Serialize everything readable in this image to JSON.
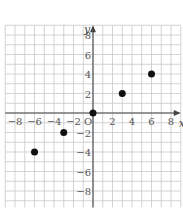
{
  "chart_data": {
    "type": "scatter",
    "title": "",
    "xlabel": "x",
    "ylabel": "y",
    "origin_label": "O",
    "xlim": [
      -9,
      9
    ],
    "ylim": [
      -9.7,
      9
    ],
    "grid": true,
    "grid_step": 1,
    "x_ticks": [
      -8,
      -6,
      -4,
      -2,
      2,
      4,
      6,
      8
    ],
    "y_ticks": [
      8,
      6,
      4,
      2,
      -2,
      -4,
      -6,
      -8
    ],
    "x_tick_labels": [
      "−8",
      "−6",
      "−4",
      "−2",
      "2",
      "4",
      "6",
      "8"
    ],
    "y_tick_labels": [
      "8",
      "6",
      "4",
      "2",
      "−2",
      "−4",
      "−6",
      "−8"
    ],
    "points": [
      {
        "x": -6,
        "y": -4
      },
      {
        "x": -3,
        "y": -2
      },
      {
        "x": 0,
        "y": 0
      },
      {
        "x": 3,
        "y": 2
      },
      {
        "x": 6,
        "y": 4
      }
    ],
    "colors": {
      "grid": "#c8c8c8",
      "axis": "#444444",
      "point": "#111111"
    }
  }
}
